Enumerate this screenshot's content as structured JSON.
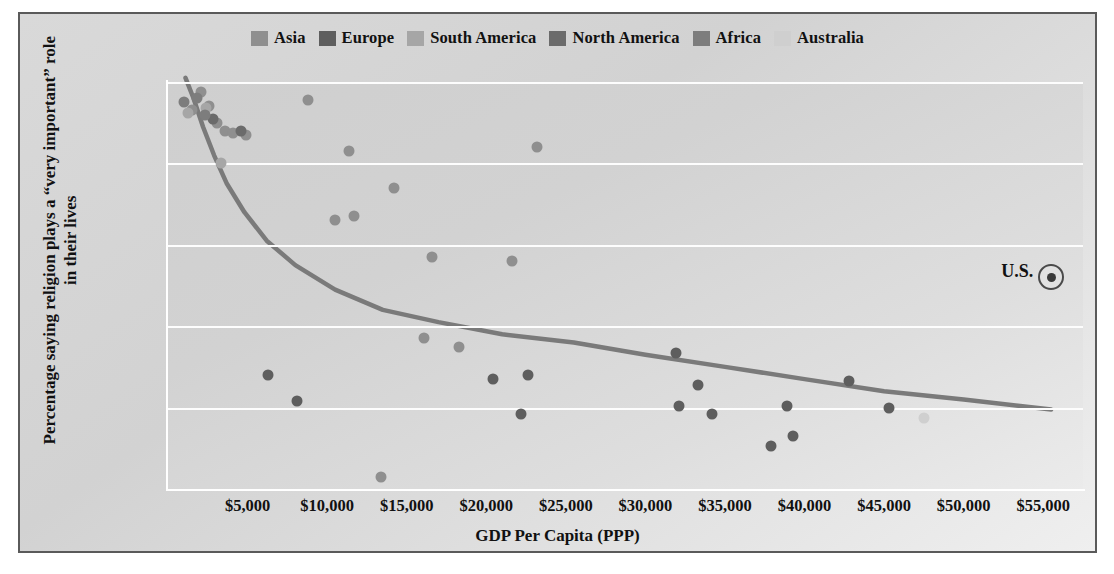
{
  "legend": {
    "items": [
      {
        "label": "Asia",
        "color": "#8f8f8f"
      },
      {
        "label": "Europe",
        "color": "#5e5e5e"
      },
      {
        "label": "South America",
        "color": "#a6a6a6"
      },
      {
        "label": "North America",
        "color": "#6b6b6b"
      },
      {
        "label": "Africa",
        "color": "#7d7d7d"
      },
      {
        "label": "Australia",
        "color": "#cfcfcf"
      }
    ]
  },
  "annotation": {
    "us_label": "U.S.",
    "us_x": 55500,
    "us_y": 52
  },
  "style": {
    "plot_bg": "#d4d4d4",
    "grid_color": "#ffffff",
    "trend_color": "#7a7a7a",
    "border_color": "#5a5a5a"
  },
  "chart_data": {
    "type": "scatter",
    "title": "",
    "xlabel": "GDP Per Capita (PPP)",
    "ylabel": "Percentage saying religion plays a “very important” role in their lives",
    "xlim": [
      0,
      57500
    ],
    "ylim": [
      0,
      100
    ],
    "xticks": [
      5000,
      10000,
      15000,
      20000,
      25000,
      30000,
      35000,
      40000,
      45000,
      50000,
      55000
    ],
    "xticklabels": [
      "$5,000",
      "$10,000",
      "$15,000",
      "$20,000",
      "$25,000",
      "$30,000",
      "$35,000",
      "$40,000",
      "$45,000",
      "$50,000",
      "$55,000"
    ],
    "yticks": [
      0,
      20,
      40,
      60,
      80,
      100
    ],
    "yticklabels": [
      "0%",
      "20%",
      "40%",
      "60%",
      "80%",
      "100%"
    ],
    "grid": "horizontal",
    "legend_position": "top-center",
    "trendline": {
      "type": "logarithmic-decay",
      "points": [
        [
          1100,
          101
        ],
        [
          1600,
          96
        ],
        [
          2200,
          89
        ],
        [
          2900,
          82
        ],
        [
          3700,
          75
        ],
        [
          4800,
          68
        ],
        [
          6200,
          61
        ],
        [
          8000,
          55
        ],
        [
          10500,
          49
        ],
        [
          13500,
          44
        ],
        [
          17000,
          41
        ],
        [
          21000,
          38
        ],
        [
          25500,
          36
        ],
        [
          30000,
          33
        ],
        [
          35000,
          30
        ],
        [
          40000,
          27
        ],
        [
          45000,
          24
        ],
        [
          50000,
          22
        ],
        [
          55500,
          19.5
        ]
      ]
    },
    "series": [
      {
        "name": "Asia",
        "color": "#8f8f8f",
        "points": [
          [
            1500,
            93
          ],
          [
            2100,
            97.5
          ],
          [
            2600,
            94
          ],
          [
            3100,
            90
          ],
          [
            3600,
            88
          ],
          [
            4100,
            87.5
          ],
          [
            4900,
            87
          ],
          [
            8800,
            95.5
          ],
          [
            11400,
            83
          ],
          [
            10500,
            66
          ],
          [
            11700,
            67
          ],
          [
            14200,
            74
          ],
          [
            16600,
            57
          ],
          [
            21600,
            56
          ],
          [
            16100,
            37
          ],
          [
            18300,
            35
          ],
          [
            23200,
            84
          ],
          [
            13400,
            3
          ]
        ]
      },
      {
        "name": "Europe",
        "color": "#5e5e5e",
        "points": [
          [
            6300,
            28
          ],
          [
            8100,
            21.5
          ],
          [
            20400,
            27
          ],
          [
            22600,
            28
          ],
          [
            22200,
            18.5
          ],
          [
            32100,
            20.5
          ],
          [
            34200,
            18.5
          ],
          [
            31900,
            33.5
          ],
          [
            33300,
            25.5
          ],
          [
            37900,
            10.5
          ],
          [
            39300,
            13
          ],
          [
            38900,
            20.5
          ],
          [
            42800,
            26.5
          ],
          [
            45300,
            20
          ]
        ]
      },
      {
        "name": "South America",
        "color": "#a6a6a6",
        "points": [
          [
            1250,
            92.5
          ],
          [
            2400,
            93.5
          ],
          [
            3300,
            80
          ]
        ]
      },
      {
        "name": "North America",
        "color": "#6b6b6b",
        "points": [
          [
            2800,
            91
          ],
          [
            4600,
            88
          ]
        ]
      },
      {
        "name": "Africa",
        "color": "#7d7d7d",
        "points": [
          [
            1000,
            95
          ],
          [
            1800,
            96
          ],
          [
            2300,
            92
          ]
        ]
      },
      {
        "name": "Australia",
        "color": "#cfcfcf",
        "points": [
          [
            47500,
            17.5
          ]
        ]
      }
    ]
  }
}
